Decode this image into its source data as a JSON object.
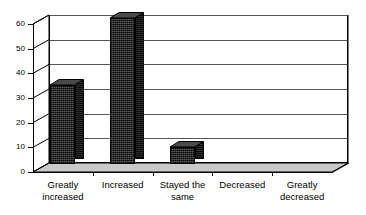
{
  "chart_data": {
    "type": "bar",
    "title": "",
    "subtitle": "",
    "xlabel": "",
    "ylabel": "",
    "categories": [
      "Greatly\nincreased",
      "Increased",
      "Stayed the\nsame",
      "Decreased",
      "Greatly\ndecreased"
    ],
    "values": [
      32,
      59,
      7,
      0,
      0
    ],
    "ylim": [
      0,
      60
    ],
    "yticks": [
      0,
      10,
      20,
      30,
      40,
      50,
      60
    ],
    "ytick_labels": [
      "0",
      "10",
      "20",
      "30",
      "40",
      "50",
      "60"
    ],
    "grid": true,
    "legend": false,
    "legend_position": "none",
    "style": "3d-column",
    "series": [
      {
        "name": "",
        "values": [
          32,
          59,
          7,
          0,
          0
        ]
      }
    ]
  },
  "colors": {
    "background": "#ffffff",
    "plot_area": "#ffffff",
    "axis": "#000000",
    "gridline": "#555555",
    "bar_front": "#3a3a3a",
    "bar_side": "#1c1c1c",
    "bar_top": "#4a4a4a",
    "text": "#000000"
  }
}
